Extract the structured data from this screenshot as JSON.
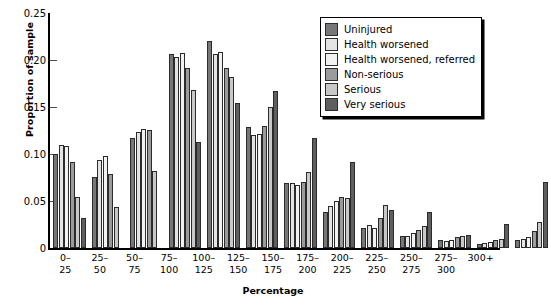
{
  "chart_data": {
    "type": "bar",
    "title": "",
    "xlabel": "Percentage",
    "ylabel": "Proportion of sample",
    "ylim": [
      0,
      0.25
    ],
    "yticks": [
      "0",
      "0.05",
      "0.10",
      "0.15",
      "0.20",
      "0.25"
    ],
    "ytick_values": [
      0,
      0.05,
      0.1,
      0.15,
      0.2,
      0.25
    ],
    "grid": false,
    "legend_position": "top-right",
    "categories": [
      "0–\n25",
      "25–\n50",
      "50–\n75",
      "75–\n100",
      "100–\n125",
      "125–\n150",
      "150–\n175",
      "175–\n200",
      "200–\n225",
      "225–\n250",
      "250–\n275",
      "275–\n300",
      "300+"
    ],
    "series": [
      {
        "name": "Uninjured",
        "color": "#77777a",
        "values": [
          0.1,
          0.076,
          0.117,
          0.206,
          0.22,
          0.129,
          0.069,
          0.038,
          0.021,
          0.013,
          0.008,
          0.004,
          0.008
        ]
      },
      {
        "name": "Health worsened",
        "color": "#e4e4e4",
        "values": [
          0.11,
          0.094,
          0.123,
          0.203,
          0.206,
          0.12,
          0.069,
          0.045,
          0.024,
          0.013,
          0.007,
          0.005,
          0.01
        ]
      },
      {
        "name": "Health worsened, referred",
        "color": "#f2f2f2",
        "values": [
          0.108,
          0.098,
          0.127,
          0.207,
          0.209,
          0.121,
          0.067,
          0.05,
          0.021,
          0.016,
          0.009,
          0.006,
          0.012
        ]
      },
      {
        "name": "Non-serious",
        "color": "#9b9b9e",
        "values": [
          0.092,
          0.079,
          0.126,
          0.192,
          0.192,
          0.13,
          0.07,
          0.054,
          0.032,
          0.019,
          0.012,
          0.008,
          0.018
        ]
      },
      {
        "name": "Serious",
        "color": "#c8c8c8",
        "values": [
          0.054,
          0.044,
          0.082,
          0.168,
          0.182,
          0.15,
          0.081,
          0.053,
          0.046,
          0.023,
          0.013,
          0.01,
          0.028
        ]
      },
      {
        "name": "Very serious",
        "color": "#5f5f62",
        "values": [
          0.032,
          0.0,
          0.0,
          0.113,
          0.154,
          0.167,
          0.117,
          0.091,
          0.04,
          0.038,
          0.014,
          0.026,
          0.07
        ]
      }
    ]
  }
}
